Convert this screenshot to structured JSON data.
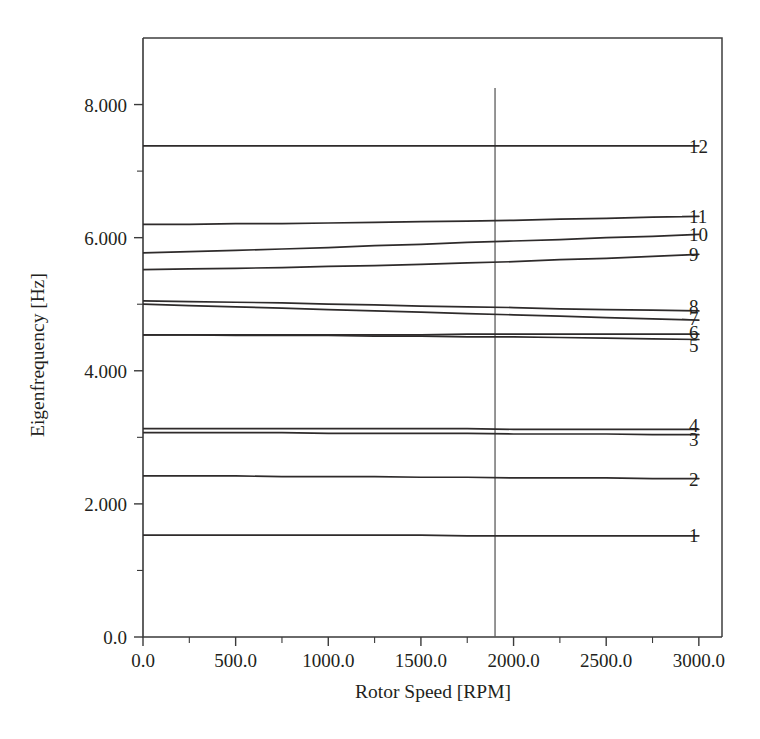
{
  "chart_data": {
    "type": "line",
    "title": "",
    "subtitle": "",
    "xlabel": "Rotor Speed [RPM]",
    "ylabel": "Eigenfrequency [Hz]",
    "xlim": [
      0,
      3125
    ],
    "ylim": [
      0.0,
      9.0
    ],
    "grid": false,
    "legend_position": "right-inline-labels",
    "x_ticks": [
      {
        "value": 0,
        "label": "0.0"
      },
      {
        "value": 500,
        "label": "500.0"
      },
      {
        "value": 1000,
        "label": "1000.0"
      },
      {
        "value": 1500,
        "label": "1500.0"
      },
      {
        "value": 2000,
        "label": "2000.0"
      },
      {
        "value": 2500,
        "label": "2500.0"
      },
      {
        "value": 3000,
        "label": "3000.0"
      }
    ],
    "x_minor_tick_interval": 250,
    "y_ticks": [
      {
        "value": 0.0,
        "label": "0.0"
      },
      {
        "value": 2.0,
        "label": "2.000"
      },
      {
        "value": 4.0,
        "label": "4.000"
      },
      {
        "value": 6.0,
        "label": "6.000"
      },
      {
        "value": 8.0,
        "label": "8.000"
      }
    ],
    "y_minor_tick_interval": 1.0,
    "annotations": [
      {
        "name": "operating-speed-line",
        "type": "vertical-line",
        "x": 1900
      }
    ],
    "x": [
      0,
      250,
      500,
      750,
      1000,
      1250,
      1500,
      1750,
      2000,
      2250,
      2500,
      2750,
      3000
    ],
    "series": [
      {
        "name": "1",
        "label": "1",
        "values": [
          1.53,
          1.53,
          1.53,
          1.53,
          1.53,
          1.53,
          1.53,
          1.52,
          1.52,
          1.52,
          1.52,
          1.52,
          1.52
        ]
      },
      {
        "name": "2",
        "label": "2",
        "values": [
          2.42,
          2.42,
          2.42,
          2.41,
          2.41,
          2.41,
          2.4,
          2.4,
          2.39,
          2.39,
          2.39,
          2.38,
          2.38
        ]
      },
      {
        "name": "3",
        "label": "3",
        "values": [
          3.07,
          3.07,
          3.07,
          3.07,
          3.06,
          3.06,
          3.06,
          3.06,
          3.05,
          3.05,
          3.05,
          3.04,
          3.04
        ]
      },
      {
        "name": "4",
        "label": "4",
        "values": [
          3.13,
          3.13,
          3.13,
          3.13,
          3.13,
          3.13,
          3.13,
          3.13,
          3.12,
          3.12,
          3.12,
          3.12,
          3.12
        ]
      },
      {
        "name": "5",
        "label": "5",
        "values": [
          4.54,
          4.54,
          4.53,
          4.53,
          4.53,
          4.52,
          4.52,
          4.51,
          4.51,
          4.5,
          4.49,
          4.48,
          4.47
        ]
      },
      {
        "name": "6",
        "label": "6",
        "values": [
          4.54,
          4.54,
          4.54,
          4.54,
          4.54,
          4.54,
          4.54,
          4.55,
          4.55,
          4.55,
          4.55,
          4.55,
          4.55
        ]
      },
      {
        "name": "7",
        "label": "7",
        "values": [
          5.0,
          4.98,
          4.96,
          4.94,
          4.92,
          4.9,
          4.88,
          4.86,
          4.84,
          4.82,
          4.8,
          4.78,
          4.76
        ]
      },
      {
        "name": "8",
        "label": "8",
        "values": [
          5.05,
          5.04,
          5.03,
          5.02,
          5.0,
          4.99,
          4.97,
          4.96,
          4.95,
          4.93,
          4.92,
          4.91,
          4.9
        ]
      },
      {
        "name": "9",
        "label": "9",
        "values": [
          5.52,
          5.53,
          5.54,
          5.55,
          5.57,
          5.58,
          5.6,
          5.62,
          5.64,
          5.67,
          5.69,
          5.72,
          5.75
        ]
      },
      {
        "name": "10",
        "label": "10",
        "values": [
          5.77,
          5.79,
          5.81,
          5.83,
          5.85,
          5.88,
          5.9,
          5.93,
          5.95,
          5.97,
          6.0,
          6.02,
          6.05
        ]
      },
      {
        "name": "11",
        "label": "11",
        "values": [
          6.2,
          6.2,
          6.21,
          6.21,
          6.22,
          6.23,
          6.24,
          6.25,
          6.26,
          6.28,
          6.29,
          6.31,
          6.32
        ]
      },
      {
        "name": "12",
        "label": "12",
        "values": [
          7.38,
          7.38,
          7.38,
          7.38,
          7.38,
          7.38,
          7.38,
          7.38,
          7.38,
          7.38,
          7.38,
          7.38,
          7.38
        ]
      }
    ],
    "label_positions": [
      {
        "name": "1",
        "y": 1.53
      },
      {
        "name": "2",
        "y": 2.38
      },
      {
        "name": "3",
        "y": 2.98
      },
      {
        "name": "4",
        "y": 3.18
      },
      {
        "name": "5",
        "y": 4.38
      },
      {
        "name": "6",
        "y": 4.58
      },
      {
        "name": "7",
        "y": 4.79
      },
      {
        "name": "8",
        "y": 4.97
      },
      {
        "name": "9",
        "y": 5.75
      },
      {
        "name": "10",
        "y": 6.05
      },
      {
        "name": "11",
        "y": 6.32
      },
      {
        "name": "12",
        "y": 7.38
      }
    ],
    "colors": {
      "curve": "#2e2b2b",
      "axis": "#3a3a3a",
      "text": "#231f20",
      "background": "#ffffff",
      "operating_line": "#5c5c5c"
    }
  }
}
